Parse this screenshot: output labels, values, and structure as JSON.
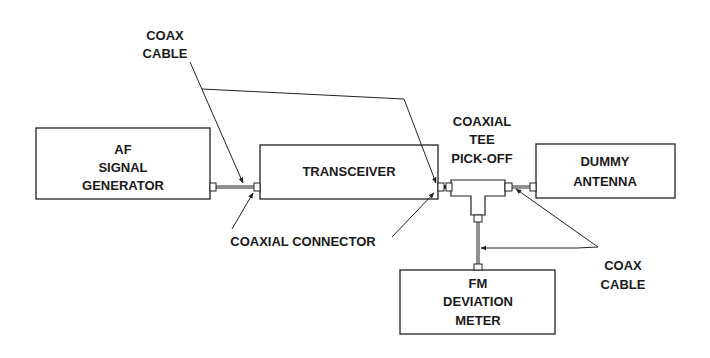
{
  "diagram": {
    "blocks": {
      "af_signal_generator": {
        "lines": [
          "AF",
          "SIGNAL",
          "GENERATOR"
        ]
      },
      "transceiver": {
        "lines": [
          "TRANSCEIVER"
        ]
      },
      "dummy_antenna": {
        "lines": [
          "DUMMY",
          "ANTENNA"
        ]
      },
      "fm_deviation_meter": {
        "lines": [
          "FM",
          "DEVIATION",
          "METER"
        ]
      }
    },
    "labels": {
      "coax_cable_top": [
        "COAX",
        "CABLE"
      ],
      "coaxial_tee": [
        "COAXIAL",
        "TEE",
        "PICK-OFF"
      ],
      "coaxial_connector": "COAXIAL CONNECTOR",
      "coax_cable_bottom": [
        "COAX",
        "CABLE"
      ]
    }
  }
}
